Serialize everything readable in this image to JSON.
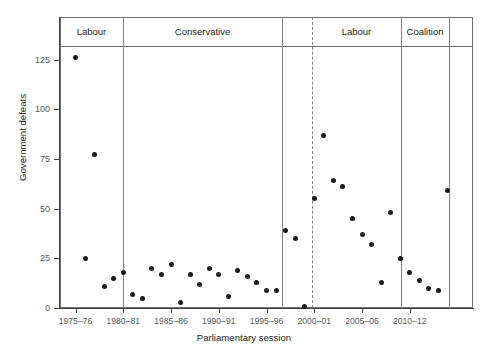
{
  "chart_data": {
    "type": "scatter",
    "title": "",
    "xlabel": "Parliamentary session",
    "ylabel": "Government defeats",
    "ylim": [
      0,
      135
    ],
    "yticks": [
      0,
      25,
      50,
      75,
      100,
      125
    ],
    "ytick_labels": [
      "0",
      "25",
      "50",
      "75",
      "100",
      "125"
    ],
    "xtick_labels": [
      "1975–76",
      "1980–81",
      "1985–86",
      "1990–91",
      "1995–96",
      "2000–01",
      "2005–06",
      "2010–12"
    ],
    "xtick_sessions": [
      1,
      6,
      11,
      16,
      21,
      26,
      31,
      36
    ],
    "grid": false,
    "legend": "none",
    "x": [
      1,
      2,
      3,
      4,
      5,
      6,
      7,
      8,
      9,
      10,
      11,
      12,
      13,
      14,
      15,
      16,
      17,
      18,
      19,
      20,
      21,
      22,
      23,
      24,
      25,
      26,
      27,
      28,
      29,
      30,
      31,
      32,
      33,
      34,
      35,
      36,
      37,
      38,
      39,
      40
    ],
    "values": [
      126,
      25,
      77,
      11,
      15,
      18,
      7,
      5,
      20,
      17,
      22,
      3,
      17,
      12,
      20,
      17,
      6,
      19,
      16,
      13,
      9,
      9,
      39,
      35,
      1,
      55,
      87,
      64,
      61,
      45,
      37,
      32,
      13,
      48,
      25,
      18,
      14,
      10,
      9,
      59
    ],
    "point_labels": [
      "1974–75",
      "1975–76",
      "1976–77",
      "1977–78",
      "1978–79",
      "1979–80",
      "1980–81",
      "1981–82",
      "1982–83",
      "1983–84",
      "1984–85",
      "1985–86",
      "1986–87",
      "1987–88",
      "1988–89",
      "1989–90",
      "1990–91",
      "1991–92",
      "1992–93",
      "1993–94",
      "1994–95",
      "1995–96",
      "1996–97",
      "1997–98",
      "1998–99",
      "1999–00",
      "2000–01",
      "2001–02",
      "2002–03",
      "2003–04",
      "2004–05",
      "2005–06",
      "2006–07",
      "2007–08",
      "2008–09",
      "2009–10",
      "2010–12",
      "2012–13",
      "2013–14",
      "2014–15"
    ],
    "dot_color": "#1a1a1a",
    "axis_color": "#414042",
    "divider_color": "#808285"
  },
  "bands": [
    {
      "label": "Labour",
      "x_start": 0,
      "x_end": 63,
      "style": "solid"
    },
    {
      "label": "Conservative",
      "x_start": 63,
      "x_end": 222,
      "style": "solid"
    },
    {
      "label": "",
      "x_start": 222,
      "x_end": 252,
      "style": "dashed"
    },
    {
      "label": "Labour",
      "x_start": 252,
      "x_end": 341,
      "style": "solid"
    },
    {
      "label": "Coalition",
      "x_start": 341,
      "x_end": 389,
      "style": "solid"
    },
    {
      "label": "",
      "x_start": 389,
      "x_end": 413,
      "style": "solid"
    }
  ],
  "dividers": [
    {
      "x": 63,
      "style": "solid"
    },
    {
      "x": 222,
      "style": "solid"
    },
    {
      "x": 252,
      "style": "dashed"
    },
    {
      "x": 341,
      "style": "solid"
    },
    {
      "x": 389,
      "style": "solid"
    }
  ]
}
